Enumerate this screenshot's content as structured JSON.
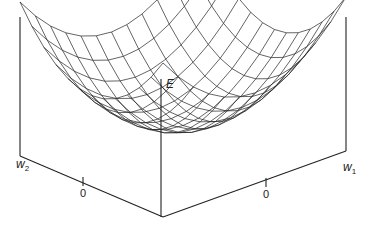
{
  "figure": {
    "type": "3d-surface-plot",
    "axes": {
      "vertical": {
        "label": "E"
      },
      "right": {
        "label": "w",
        "subscript": "1",
        "tick": "0"
      },
      "left": {
        "label": "w",
        "subscript": "2",
        "tick": "0"
      }
    },
    "colors": {
      "line": "#222222",
      "background": "#ffffff"
    },
    "mesh": {
      "resolution": 12
    }
  }
}
